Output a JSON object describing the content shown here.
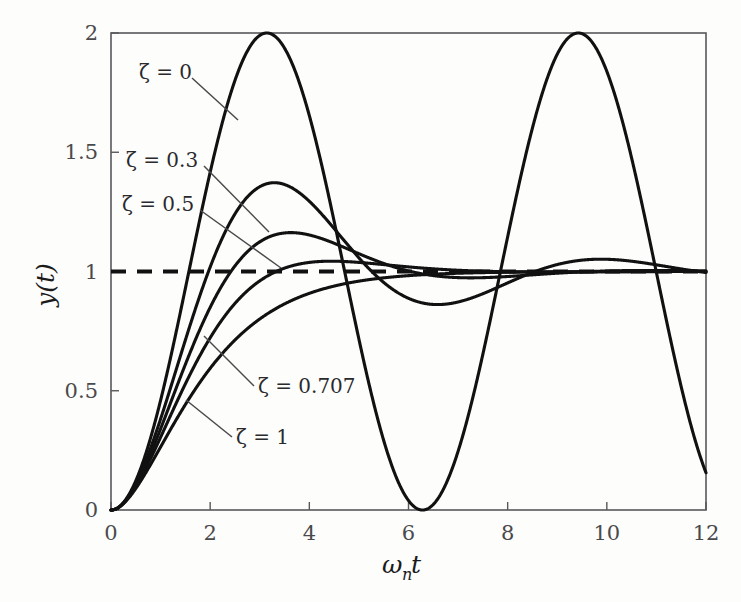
{
  "figure": {
    "background_color": "#fdfdfc",
    "curve_color": "#111111",
    "axis_color": "#58585a",
    "reference_color": "#111111"
  },
  "axes": {
    "x_title_omega": "ω",
    "x_title_sub": "n",
    "x_title_t": "t",
    "y_title": "y(t)",
    "x_ticks": [
      "0",
      "2",
      "4",
      "6",
      "8",
      "10",
      "12"
    ],
    "y_ticks": [
      "0",
      "0.5",
      "1",
      "1.5",
      "2"
    ]
  },
  "annotations": {
    "zeta0": "ζ = 0",
    "zeta03": "ζ = 0.3",
    "zeta05": "ζ = 0.5",
    "zeta0707": "ζ = 0.707",
    "zeta1": "ζ = 1"
  },
  "chart_data": {
    "type": "line",
    "title": "",
    "xlabel": "ω_n t",
    "ylabel": "y(t)",
    "xlim": [
      0,
      12
    ],
    "ylim": [
      0,
      2
    ],
    "xticks": [
      0,
      2,
      4,
      6,
      8,
      10,
      12
    ],
    "yticks": [
      0,
      0.5,
      1,
      1.5,
      2
    ],
    "grid": false,
    "legend": "inline-annotations",
    "reference_lines": [
      {
        "name": "steady-state",
        "axis": "y",
        "value": 1,
        "style": "dashed"
      }
    ],
    "x": [
      0,
      0.25,
      0.5,
      0.75,
      1,
      1.25,
      1.5,
      1.75,
      2,
      2.25,
      2.5,
      2.75,
      3,
      3.25,
      3.5,
      3.75,
      4,
      4.25,
      4.5,
      4.75,
      5,
      5.25,
      5.5,
      5.75,
      6,
      6.25,
      6.5,
      6.75,
      7,
      7.25,
      7.5,
      7.75,
      8,
      8.25,
      8.5,
      8.75,
      9,
      9.25,
      9.5,
      9.75,
      10,
      10.25,
      10.5,
      10.75,
      11,
      11.25,
      11.5,
      11.75,
      12
    ],
    "series": [
      {
        "name": "ζ = 0",
        "zeta": 0,
        "peak_value": 2.0,
        "peak_time": 3.14,
        "values": [
          0,
          0.031,
          0.122,
          0.268,
          0.46,
          0.685,
          0.929,
          1.178,
          1.416,
          1.63,
          1.802,
          1.927,
          1.99,
          1.991,
          1.936,
          1.82,
          1.654,
          1.449,
          1.22,
          0.98,
          0.716,
          0.478,
          0.291,
          0.129,
          0.04,
          0.0,
          0.031,
          0.122,
          0.246,
          0.444,
          0.654,
          0.901,
          1.145,
          1.386,
          1.601,
          1.79,
          1.911,
          1.99,
          1.993,
          1.939,
          1.839,
          1.673,
          1.471,
          1.24,
          0.996,
          0.74,
          0.498,
          0.297,
          0.143
        ]
      },
      {
        "name": "ζ = 0.3",
        "zeta": 0.3,
        "peak_value": 1.372,
        "peak_time": 3.29,
        "values": [
          0,
          0.029,
          0.111,
          0.233,
          0.384,
          0.549,
          0.716,
          0.875,
          1.016,
          1.135,
          1.229,
          1.295,
          1.334,
          1.349,
          1.343,
          1.32,
          1.284,
          1.241,
          1.192,
          1.143,
          1.094,
          1.05,
          1.011,
          0.979,
          0.955,
          0.938,
          0.928,
          0.925,
          0.928,
          0.935,
          0.945,
          0.958,
          0.972,
          0.986,
          1.0,
          1.011,
          1.021,
          1.028,
          1.032,
          1.034,
          1.034,
          1.032,
          1.028,
          1.023,
          1.017,
          1.011,
          1.005,
          1.0,
          0.995
        ]
      },
      {
        "name": "ζ = 0.5",
        "zeta": 0.5,
        "peak_value": 1.163,
        "peak_time": 3.63,
        "values": [
          0,
          0.027,
          0.102,
          0.207,
          0.33,
          0.458,
          0.583,
          0.697,
          0.796,
          0.878,
          0.942,
          0.989,
          1.021,
          1.04,
          1.049,
          1.049,
          1.044,
          1.035,
          1.023,
          1.011,
          0.999,
          0.988,
          0.978,
          0.971,
          0.966,
          0.963,
          0.962,
          0.962,
          0.964,
          0.967,
          0.97,
          0.974,
          0.978,
          0.982,
          0.986,
          0.989,
          0.992,
          0.995,
          0.997,
          0.998,
          0.999,
          1.0,
          1.001,
          1.001,
          1.001,
          1.001,
          1.0,
          1.0,
          1.0
        ]
      },
      {
        "name": "ζ = 0.707",
        "zeta": 0.707,
        "peak_value": 1.043,
        "peak_time": 4.44,
        "values": [
          0,
          0.024,
          0.09,
          0.179,
          0.28,
          0.381,
          0.476,
          0.561,
          0.634,
          0.694,
          0.742,
          0.779,
          0.807,
          0.828,
          0.843,
          0.854,
          0.861,
          0.866,
          0.869,
          0.871,
          0.872,
          0.873,
          0.874,
          0.875,
          0.876,
          0.877,
          0.878,
          0.879,
          0.88,
          0.881,
          0.883,
          0.884,
          0.885,
          0.886,
          0.887,
          0.888,
          0.889,
          0.889,
          0.89,
          0.89,
          0.891,
          0.891,
          0.891,
          0.892,
          0.892,
          0.892,
          0.892,
          0.892,
          0.892
        ]
      },
      {
        "name": "ζ = 1",
        "zeta": 1,
        "peak_value": 1.0,
        "peak_time": null,
        "values": [
          0,
          0.0265,
          0.0902,
          0.1734,
          0.2642,
          0.3554,
          0.4422,
          0.5221,
          0.594,
          0.6578,
          0.7127,
          0.7599,
          0.8009,
          0.8355,
          0.8641,
          0.8883,
          0.9084,
          0.9249,
          0.9389,
          0.9501,
          0.9596,
          0.9672,
          0.9735,
          0.9787,
          0.9826,
          0.9862,
          0.9887,
          0.9911,
          0.9927,
          0.9941,
          0.9953,
          0.9962,
          0.997,
          0.9975,
          0.998,
          0.9984,
          0.9988,
          0.999,
          0.9992,
          0.9994,
          0.9995,
          0.9996,
          0.9997,
          0.9998,
          0.9998,
          0.9999,
          0.9999,
          0.9999,
          0.9999
        ]
      }
    ]
  }
}
